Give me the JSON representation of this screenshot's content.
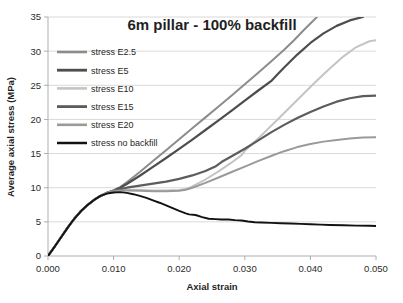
{
  "chart_data": {
    "type": "line",
    "title": "6m pillar - 100% backfill",
    "xlabel": "Axial strain",
    "ylabel": "Average axial stress (MPa)",
    "xlim": [
      0.0,
      0.05
    ],
    "ylim": [
      0,
      35
    ],
    "xticks": [
      0.0,
      0.01,
      0.02,
      0.03,
      0.04,
      0.05
    ],
    "xtick_labels": [
      "0.000",
      "0.010",
      "0.020",
      "0.030",
      "0.040",
      "0.050"
    ],
    "yticks": [
      0,
      5,
      10,
      15,
      20,
      25,
      30,
      35
    ],
    "ytick_labels": [
      "0",
      "5",
      "10",
      "15",
      "20",
      "25",
      "30",
      "35"
    ],
    "grid": "horizontal",
    "legend_position": "upper-left-inside",
    "series": [
      {
        "name": "stress E2.5",
        "color": "#8c8c8c",
        "width": 2.0,
        "points": [
          [
            0.0,
            0.0
          ],
          [
            0.001,
            1.35
          ],
          [
            0.002,
            2.75
          ],
          [
            0.003,
            4.15
          ],
          [
            0.004,
            5.45
          ],
          [
            0.005,
            6.55
          ],
          [
            0.006,
            7.45
          ],
          [
            0.007,
            8.2
          ],
          [
            0.008,
            8.8
          ],
          [
            0.009,
            9.25
          ],
          [
            0.01,
            9.6
          ],
          [
            0.011,
            10.1
          ],
          [
            0.012,
            10.8
          ],
          [
            0.014,
            12.3
          ],
          [
            0.016,
            13.9
          ],
          [
            0.018,
            15.5
          ],
          [
            0.02,
            17.1
          ],
          [
            0.022,
            18.7
          ],
          [
            0.024,
            20.3
          ],
          [
            0.026,
            21.9
          ],
          [
            0.028,
            23.5
          ],
          [
            0.03,
            25.15
          ],
          [
            0.032,
            26.8
          ],
          [
            0.034,
            28.5
          ],
          [
            0.036,
            30.2
          ],
          [
            0.0375,
            31.6
          ],
          [
            0.039,
            33.1
          ],
          [
            0.041,
            35.0
          ]
        ]
      },
      {
        "name": "stress E5",
        "color": "#4d4d4d",
        "width": 2.2,
        "points": [
          [
            0.0,
            0.0
          ],
          [
            0.001,
            1.35
          ],
          [
            0.002,
            2.75
          ],
          [
            0.003,
            4.15
          ],
          [
            0.004,
            5.45
          ],
          [
            0.005,
            6.55
          ],
          [
            0.006,
            7.45
          ],
          [
            0.007,
            8.2
          ],
          [
            0.008,
            8.8
          ],
          [
            0.009,
            9.25
          ],
          [
            0.01,
            9.6
          ],
          [
            0.011,
            10.0
          ],
          [
            0.012,
            10.55
          ],
          [
            0.014,
            11.75
          ],
          [
            0.016,
            13.05
          ],
          [
            0.018,
            14.35
          ],
          [
            0.02,
            15.7
          ],
          [
            0.022,
            17.05
          ],
          [
            0.024,
            18.45
          ],
          [
            0.026,
            19.85
          ],
          [
            0.028,
            21.3
          ],
          [
            0.03,
            22.75
          ],
          [
            0.032,
            24.2
          ],
          [
            0.034,
            25.6
          ],
          [
            0.035,
            26.6
          ],
          [
            0.036,
            27.6
          ],
          [
            0.038,
            29.5
          ],
          [
            0.04,
            31.2
          ],
          [
            0.042,
            32.6
          ],
          [
            0.044,
            33.7
          ],
          [
            0.046,
            34.5
          ],
          [
            0.048,
            35.0
          ]
        ]
      },
      {
        "name": "stress E10",
        "color": "#c4c4c4",
        "width": 2.0,
        "points": [
          [
            0.0,
            0.0
          ],
          [
            0.001,
            1.35
          ],
          [
            0.002,
            2.75
          ],
          [
            0.003,
            4.15
          ],
          [
            0.004,
            5.45
          ],
          [
            0.005,
            6.55
          ],
          [
            0.006,
            7.45
          ],
          [
            0.007,
            8.2
          ],
          [
            0.008,
            8.8
          ],
          [
            0.009,
            9.25
          ],
          [
            0.01,
            9.55
          ],
          [
            0.011,
            9.7
          ],
          [
            0.012,
            9.7
          ],
          [
            0.014,
            9.65
          ],
          [
            0.016,
            9.6
          ],
          [
            0.018,
            9.6
          ],
          [
            0.02,
            9.65
          ],
          [
            0.021,
            9.8
          ],
          [
            0.022,
            10.2
          ],
          [
            0.024,
            11.2
          ],
          [
            0.026,
            12.4
          ],
          [
            0.028,
            13.7
          ],
          [
            0.0295,
            14.75
          ],
          [
            0.03,
            15.4
          ],
          [
            0.031,
            16.3
          ],
          [
            0.033,
            18.1
          ],
          [
            0.035,
            20.0
          ],
          [
            0.037,
            21.9
          ],
          [
            0.039,
            23.8
          ],
          [
            0.041,
            25.7
          ],
          [
            0.043,
            27.5
          ],
          [
            0.045,
            29.2
          ],
          [
            0.047,
            30.6
          ],
          [
            0.049,
            31.45
          ],
          [
            0.05,
            31.6
          ]
        ]
      },
      {
        "name": "stress E15",
        "color": "#5c5c5c",
        "width": 2.2,
        "points": [
          [
            0.0,
            0.0
          ],
          [
            0.001,
            1.35
          ],
          [
            0.002,
            2.75
          ],
          [
            0.003,
            4.15
          ],
          [
            0.004,
            5.45
          ],
          [
            0.005,
            6.55
          ],
          [
            0.006,
            7.45
          ],
          [
            0.007,
            8.2
          ],
          [
            0.008,
            8.8
          ],
          [
            0.009,
            9.25
          ],
          [
            0.01,
            9.55
          ],
          [
            0.011,
            9.8
          ],
          [
            0.012,
            10.0
          ],
          [
            0.014,
            10.3
          ],
          [
            0.016,
            10.6
          ],
          [
            0.018,
            10.9
          ],
          [
            0.02,
            11.3
          ],
          [
            0.022,
            11.8
          ],
          [
            0.024,
            12.45
          ],
          [
            0.0255,
            13.1
          ],
          [
            0.0265,
            13.8
          ],
          [
            0.028,
            14.6
          ],
          [
            0.03,
            15.7
          ],
          [
            0.032,
            16.9
          ],
          [
            0.034,
            18.1
          ],
          [
            0.036,
            19.2
          ],
          [
            0.038,
            20.2
          ],
          [
            0.04,
            21.1
          ],
          [
            0.042,
            21.9
          ],
          [
            0.044,
            22.6
          ],
          [
            0.046,
            23.1
          ],
          [
            0.048,
            23.4
          ],
          [
            0.05,
            23.5
          ]
        ]
      },
      {
        "name": "stress E20",
        "color": "#9a9a9a",
        "width": 2.0,
        "points": [
          [
            0.0,
            0.0
          ],
          [
            0.001,
            1.35
          ],
          [
            0.002,
            2.75
          ],
          [
            0.003,
            4.15
          ],
          [
            0.004,
            5.45
          ],
          [
            0.005,
            6.55
          ],
          [
            0.006,
            7.45
          ],
          [
            0.007,
            8.2
          ],
          [
            0.008,
            8.8
          ],
          [
            0.009,
            9.25
          ],
          [
            0.01,
            9.5
          ],
          [
            0.011,
            9.6
          ],
          [
            0.012,
            9.6
          ],
          [
            0.014,
            9.55
          ],
          [
            0.016,
            9.5
          ],
          [
            0.018,
            9.5
          ],
          [
            0.02,
            9.55
          ],
          [
            0.021,
            9.7
          ],
          [
            0.022,
            10.0
          ],
          [
            0.024,
            10.7
          ],
          [
            0.026,
            11.5
          ],
          [
            0.028,
            12.3
          ],
          [
            0.03,
            13.1
          ],
          [
            0.032,
            13.9
          ],
          [
            0.034,
            14.65
          ],
          [
            0.036,
            15.35
          ],
          [
            0.038,
            15.95
          ],
          [
            0.04,
            16.4
          ],
          [
            0.042,
            16.75
          ],
          [
            0.044,
            17.0
          ],
          [
            0.046,
            17.2
          ],
          [
            0.048,
            17.35
          ],
          [
            0.05,
            17.4
          ]
        ]
      },
      {
        "name": "stress no backfill",
        "color": "#121212",
        "width": 1.9,
        "points": [
          [
            0.0,
            0.0
          ],
          [
            0.001,
            1.35
          ],
          [
            0.002,
            2.75
          ],
          [
            0.003,
            4.15
          ],
          [
            0.004,
            5.45
          ],
          [
            0.005,
            6.55
          ],
          [
            0.006,
            7.45
          ],
          [
            0.007,
            8.2
          ],
          [
            0.008,
            8.8
          ],
          [
            0.009,
            9.15
          ],
          [
            0.01,
            9.3
          ],
          [
            0.011,
            9.35
          ],
          [
            0.012,
            9.25
          ],
          [
            0.013,
            9.05
          ],
          [
            0.014,
            8.8
          ],
          [
            0.015,
            8.5
          ],
          [
            0.016,
            8.15
          ],
          [
            0.017,
            7.8
          ],
          [
            0.018,
            7.4
          ],
          [
            0.019,
            7.0
          ],
          [
            0.02,
            6.6
          ],
          [
            0.021,
            6.25
          ],
          [
            0.0215,
            6.1
          ],
          [
            0.0225,
            6.0
          ],
          [
            0.0235,
            5.7
          ],
          [
            0.0245,
            5.45
          ],
          [
            0.0255,
            5.4
          ],
          [
            0.0265,
            5.35
          ],
          [
            0.0275,
            5.35
          ],
          [
            0.0285,
            5.25
          ],
          [
            0.0295,
            5.2
          ],
          [
            0.0305,
            5.05
          ],
          [
            0.0315,
            4.95
          ],
          [
            0.0325,
            4.9
          ],
          [
            0.034,
            4.85
          ],
          [
            0.0355,
            4.8
          ],
          [
            0.037,
            4.75
          ],
          [
            0.0385,
            4.7
          ],
          [
            0.04,
            4.65
          ],
          [
            0.0415,
            4.6
          ],
          [
            0.043,
            4.55
          ],
          [
            0.045,
            4.5
          ],
          [
            0.047,
            4.45
          ],
          [
            0.049,
            4.42
          ],
          [
            0.05,
            4.4
          ]
        ]
      }
    ]
  }
}
